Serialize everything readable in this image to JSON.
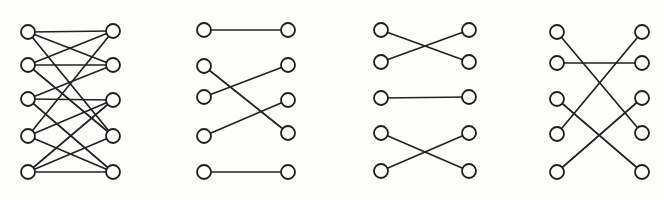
{
  "figure": {
    "kind": "bipartite-graph-diagrams",
    "background_color": "#fdfdfc",
    "edge_color": "#222222",
    "node_fill_color": "#fdfdfc",
    "node_stroke_color": "#1e1e1e",
    "node_radius": 7,
    "canvas": {
      "width": 665,
      "height": 199
    }
  },
  "graphs": [
    {
      "name": "bipartite-graph-1",
      "left_x": 28,
      "right_x": 113,
      "left_y": [
        32,
        65,
        99,
        136,
        172
      ],
      "right_y": [
        31,
        65,
        100,
        136,
        172
      ],
      "edges": [
        [
          0,
          0
        ],
        [
          0,
          1
        ],
        [
          0,
          3
        ],
        [
          1,
          0
        ],
        [
          1,
          1
        ],
        [
          1,
          3
        ],
        [
          2,
          1
        ],
        [
          2,
          2
        ],
        [
          2,
          4
        ],
        [
          3,
          0
        ],
        [
          3,
          2
        ],
        [
          3,
          4
        ],
        [
          4,
          2
        ],
        [
          4,
          3
        ],
        [
          4,
          4
        ]
      ]
    },
    {
      "name": "bipartite-graph-2",
      "left_x": 204,
      "right_x": 288,
      "left_y": [
        30,
        66,
        97,
        136,
        172
      ],
      "right_y": [
        30,
        65,
        100,
        133,
        172
      ],
      "edges": [
        [
          0,
          0
        ],
        [
          1,
          3
        ],
        [
          2,
          1
        ],
        [
          3,
          2
        ],
        [
          4,
          4
        ]
      ]
    },
    {
      "name": "bipartite-graph-3",
      "left_x": 381,
      "right_x": 469,
      "left_y": [
        30,
        62,
        98,
        133,
        171
      ],
      "right_y": [
        30,
        62,
        97,
        133,
        171
      ],
      "edges": [
        [
          0,
          1
        ],
        [
          1,
          0
        ],
        [
          2,
          2
        ],
        [
          3,
          4
        ],
        [
          4,
          3
        ]
      ]
    },
    {
      "name": "bipartite-graph-4",
      "left_x": 557,
      "right_x": 642,
      "left_y": [
        32,
        63,
        99,
        134,
        172
      ],
      "right_y": [
        32,
        63,
        98,
        133,
        172
      ],
      "edges": [
        [
          0,
          3
        ],
        [
          1,
          1
        ],
        [
          2,
          4
        ],
        [
          3,
          0
        ],
        [
          4,
          2
        ]
      ]
    }
  ]
}
